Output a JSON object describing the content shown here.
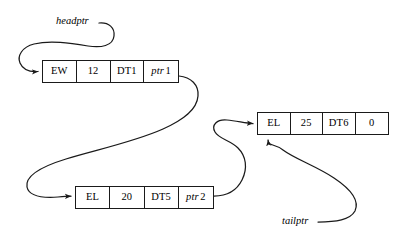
{
  "diagram": {
    "background_color": "#ffffff",
    "stroke_color": "#1a1a1a",
    "nodes": [
      {
        "id": "node-1",
        "cells": [
          {
            "name": "name-field",
            "value": "EW"
          },
          {
            "name": "count-field",
            "value": "12"
          },
          {
            "name": "data-field",
            "value": "DT1"
          },
          {
            "name": "next-pointer-field",
            "value": "ptr",
            "index": "1"
          }
        ]
      },
      {
        "id": "node-2",
        "cells": [
          {
            "name": "name-field",
            "value": "EL"
          },
          {
            "name": "count-field",
            "value": "20"
          },
          {
            "name": "data-field",
            "value": "DT5"
          },
          {
            "name": "next-pointer-field",
            "value": "ptr",
            "index": "2"
          }
        ]
      },
      {
        "id": "node-3",
        "cells": [
          {
            "name": "name-field",
            "value": "EL"
          },
          {
            "name": "count-field",
            "value": "25"
          },
          {
            "name": "data-field",
            "value": "DT6"
          },
          {
            "name": "next-pointer-field",
            "value": "0",
            "index": ""
          }
        ]
      }
    ],
    "labels": {
      "headptr": "headptr",
      "tailptr": "tailptr"
    },
    "arrows": [
      {
        "name": "headptr-arrow",
        "from": "headptr-label",
        "to": "node-1"
      },
      {
        "name": "node1-next-arrow",
        "from": "node-1-ptr1",
        "to": "node-2"
      },
      {
        "name": "node2-next-arrow",
        "from": "node-2-ptr2",
        "to": "node-3"
      },
      {
        "name": "tailptr-arrow",
        "from": "tailptr-label",
        "to": "node-3"
      }
    ]
  }
}
